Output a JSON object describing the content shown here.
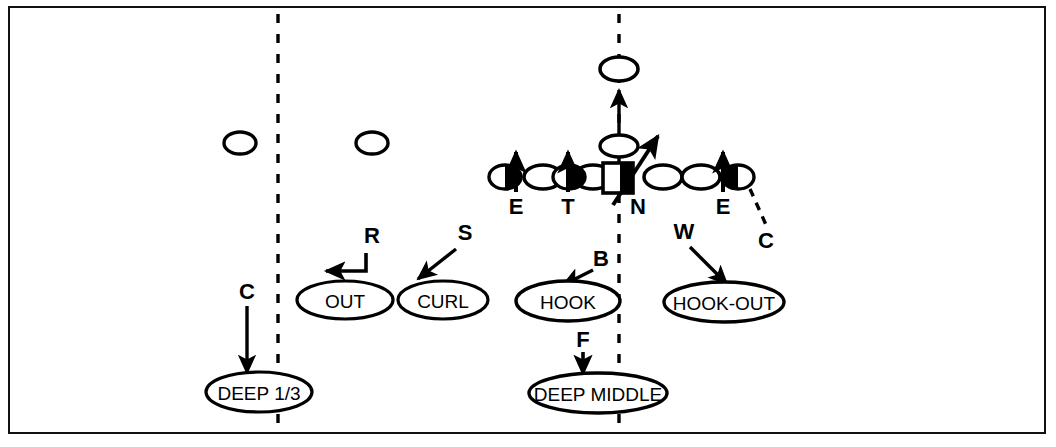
{
  "diagram": {
    "frame_color": "#111111",
    "background_color": "#ffffff",
    "line_color": "#000000",
    "width": 1056,
    "height": 447
  },
  "hash_marks": [
    {
      "name": "left-hash",
      "x": 278,
      "y_top": 14,
      "y_bottom": 424
    },
    {
      "name": "right-hash",
      "x": 619,
      "y_top": 14,
      "y_bottom": 424
    }
  ],
  "offense": {
    "receivers": [
      {
        "label": "",
        "cx": 240,
        "cy": 143,
        "rx": 16,
        "ry": 11
      },
      {
        "label": "",
        "cx": 372,
        "cy": 143,
        "rx": 16,
        "ry": 11
      },
      {
        "label": "",
        "cx": 619,
        "cy": 69,
        "rx": 19,
        "ry": 12
      }
    ],
    "linemen": [
      {
        "label": "",
        "cx": 543,
        "cy": 177,
        "rx": 19,
        "ry": 12
      },
      {
        "label": "",
        "cx": 593,
        "cy": 177,
        "rx": 19,
        "ry": 12
      },
      {
        "label": "",
        "cx": 663,
        "cy": 177,
        "rx": 19,
        "ry": 12
      },
      {
        "label": "",
        "cx": 701,
        "cy": 177,
        "rx": 19,
        "ry": 12
      }
    ],
    "center": {
      "label": "",
      "x": 603,
      "y": 163,
      "w": 30,
      "h": 30
    },
    "quarterback": {
      "label": "",
      "cx": 619,
      "cy": 146,
      "rx": 19,
      "ry": 11
    },
    "qb_motion": {
      "from_x": 619,
      "from_y": 134,
      "to_x": 619,
      "to_y": 86
    }
  },
  "defenders": [
    {
      "key": "E",
      "label": "E",
      "cx": 505,
      "cy": 177,
      "rx": 16,
      "ry": 12,
      "label_x": 516,
      "label_y": 212,
      "rush_from_y": 168,
      "rush_to_y": 150,
      "rush_x": 516
    },
    {
      "key": "T",
      "label": "T",
      "cx": 569,
      "cy": 177,
      "rx": 16,
      "ry": 12,
      "label_x": 568,
      "label_y": 212,
      "rush_from_y": 190,
      "rush_to_y": 150,
      "rush_x": 568
    },
    {
      "key": "N",
      "label": "N",
      "cx": 619,
      "cy": 177,
      "rx": 0,
      "ry": 0,
      "label_x": 637,
      "label_y": 212,
      "rush_from_y": 0,
      "rush_to_y": 0,
      "rush_x": 0
    },
    {
      "key": "E2",
      "label": "E",
      "cx": 738,
      "cy": 177,
      "rx": 16,
      "ry": 12,
      "label_x": 723,
      "label_y": 212,
      "rush_from_y": 190,
      "rush_to_y": 150,
      "rush_x": 723
    }
  ],
  "nose_stunt": {
    "from_x": 615,
    "from_y": 203,
    "to_x": 657,
    "to_y": 138
  },
  "coverage_zones": [
    {
      "name": "out-zone",
      "label": "OUT",
      "cx": 345,
      "cy": 300,
      "rx": 48,
      "ry": 19,
      "defender_key": "R",
      "key_x": 371,
      "key_y": 243,
      "arrow_type": "elbow",
      "arrow_path": "M 366,252 L 366,271 L 323,271"
    },
    {
      "name": "curl-zone",
      "label": "CURL",
      "cx": 443,
      "cy": 300,
      "rx": 45,
      "ry": 19,
      "defender_key": "S",
      "key_x": 464,
      "key_y": 238,
      "arrow_type": "straight",
      "arrow_path": "M 458,248 L 416,279"
    },
    {
      "name": "hook-zone",
      "label": "HOOK",
      "cx": 568,
      "cy": 301,
      "rx": 52,
      "ry": 20,
      "defender_key": "B",
      "key_x": 599,
      "key_y": 264,
      "arrow_type": "straight",
      "arrow_path": "M 592,269 L 561,284"
    },
    {
      "name": "hook-out-zone",
      "label": "HOOK-OUT",
      "cx": 724,
      "cy": 302,
      "rx": 60,
      "ry": 20,
      "defender_key": "W",
      "key_x": 684,
      "key_y": 237,
      "arrow_type": "straight",
      "arrow_path": "M 687,245 L 726,284"
    },
    {
      "name": "deep-third-zone",
      "label": "DEEP 1/3",
      "cx": 259,
      "cy": 392,
      "rx": 53,
      "ry": 20,
      "defender_key": "C",
      "key_x": 249,
      "key_y": 295,
      "arrow_type": "straight",
      "arrow_path": "M 247,305 L 247,372"
    },
    {
      "name": "deep-middle-zone",
      "label": "DEEP MIDDLE",
      "cx": 598,
      "cy": 393,
      "rx": 69,
      "ry": 20,
      "defender_key": "F",
      "key_x": 584,
      "key_y": 344,
      "arrow_type": "straight",
      "arrow_path": "M 583,351 L 583,373"
    }
  ],
  "corner_drop": {
    "defender_key": "C",
    "key_x": 765,
    "key_y": 242,
    "path": "M 748,186 L 765,228",
    "style": "dashed"
  }
}
